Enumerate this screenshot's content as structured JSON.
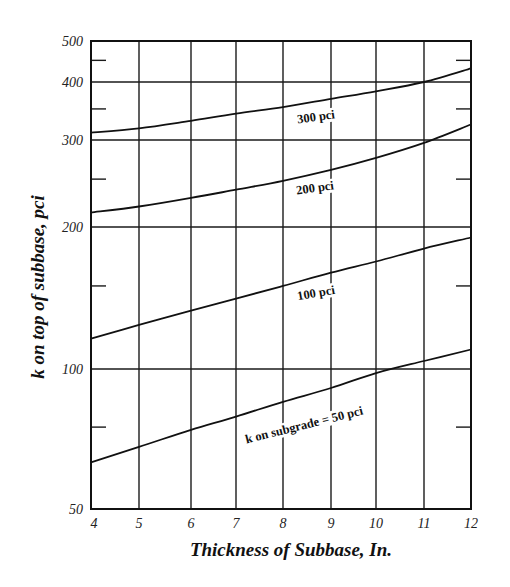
{
  "chart_data": {
    "type": "line",
    "title": "",
    "xlabel": "Thickness of Subbase, In.",
    "ylabel": "k on top of subbase, pci",
    "xlim": [
      4,
      12
    ],
    "ylim": [
      50,
      500
    ],
    "yscale": "log",
    "grid": true,
    "legend": "inline curve labels",
    "x_ticks": [
      "4",
      "5",
      "6",
      "7",
      "8",
      "9",
      "10",
      "11",
      "12"
    ],
    "y_ticks": [
      "50",
      "100",
      "200",
      "300",
      "400",
      "500"
    ],
    "y_minor_ticks": [
      75,
      150,
      250,
      350,
      450
    ],
    "x": [
      4,
      5,
      6,
      7,
      8,
      9,
      10,
      11,
      12
    ],
    "series": [
      {
        "name": "k on subgrade = 50 pci",
        "label": "k on subgrade = 50 pci",
        "values": [
          63,
          68,
          74,
          79,
          85,
          91,
          98,
          104,
          110
        ]
      },
      {
        "name": "100 pci",
        "label": "100 pci",
        "values": [
          116,
          124,
          133,
          141,
          150,
          160,
          169,
          180,
          190
        ]
      },
      {
        "name": "200 pci",
        "label": "200 pci",
        "values": [
          214,
          220,
          229,
          238,
          248,
          261,
          276,
          296,
          324
        ]
      },
      {
        "name": "300 pci",
        "label": "300 pci",
        "values": [
          311,
          318,
          330,
          342,
          353,
          368,
          382,
          400,
          431
        ]
      }
    ]
  },
  "layout": {
    "plot": {
      "left": 91,
      "right": 471,
      "top": 41,
      "bottom": 509
    },
    "x_pixels": [
      91,
      139,
      191,
      236,
      283,
      331,
      376,
      424,
      471
    ],
    "y_gridlines": [
      {
        "value": 50,
        "y": 509
      },
      {
        "value": 100,
        "y": 369
      },
      {
        "value": 200,
        "y": 227
      },
      {
        "value": 300,
        "y": 140
      },
      {
        "value": 400,
        "y": 82
      },
      {
        "value": 500,
        "y": 41
      }
    ],
    "curve_labels": [
      {
        "series": 3,
        "x": 316,
        "y": 117,
        "angle": -8
      },
      {
        "series": 2,
        "x": 315,
        "y": 188,
        "angle": -8
      },
      {
        "series": 1,
        "x": 316,
        "y": 293,
        "angle": -10
      },
      {
        "series": 0,
        "x": 304,
        "y": 425,
        "angle": -14
      }
    ]
  }
}
